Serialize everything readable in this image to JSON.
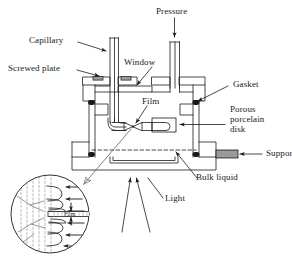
{
  "figure": {
    "type": "schematic-cross-section",
    "line_color": "#1a1a1a",
    "fill_gray": "#9a9a9a",
    "fill_light": "#d8d8d8",
    "background": "#ffffff"
  },
  "labels": {
    "pressure": "Pressure",
    "capillary": "Capillary",
    "screwed_plate": "Screwed plate",
    "window": "Window",
    "film": "Film",
    "gasket": "Gasket",
    "porous_porcelain_disk": "Porous\nporcelain\ndisk",
    "porous_line1": "Porous",
    "porous_line2": "porcelain",
    "porous_line3": "disk",
    "support": "Support",
    "bulk_liquid": "Bulk liquid",
    "light": "Light",
    "inset_film": "Film"
  },
  "components": {
    "capillary_tube": "vertical double-wall tube entering cell from top left",
    "pressure_tube": "vertical double-wall tube entering cell from top right",
    "window_plate": "horizontal optical window in upper chamber",
    "screwed_plate_bolts": "two gray bolt heads on top plate",
    "gaskets": "four black gasket dots at chamber corners",
    "film_holder": "two tapered tubes meeting at central film",
    "porous_disk": "rounded element to right of film holder",
    "liquid_level": "dashed horizontal line marking bulk liquid surface",
    "support_block": "gray filled block at lower right",
    "light_rays": "two upward converging arrows below cell",
    "inset_circle": "magnified circular detail of film and meniscus"
  },
  "inset": {
    "description": "magnified detail of film plateau border",
    "elements": [
      "dashed liquid striations",
      "scalloped meniscus arcs",
      "inward pressure arrows",
      "horizontal film band",
      "vertical thickness arrows"
    ],
    "meniscus_count_upper": 3,
    "meniscus_count_lower": 3,
    "arrow_count": 6
  }
}
